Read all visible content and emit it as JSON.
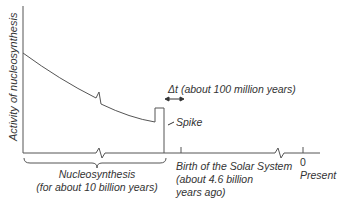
{
  "diagram": {
    "y_axis_label": "Activity of nucleosynthesis",
    "delta_t_label": "Δt (about 100 million years)",
    "spike_label": "Spike",
    "nucleosynthesis_label": {
      "line1": "Nucleosynthesis",
      "line2": "(for about 10 billion years)"
    },
    "birth_label": {
      "line1": "Birth of the Solar System",
      "line2": "(about 4.6 billion",
      "line3": "years ago)"
    },
    "present_label": {
      "tick": "0",
      "text": "Present"
    },
    "colors": {
      "line": "#555555",
      "text": "#333333",
      "background": "#ffffff"
    }
  }
}
